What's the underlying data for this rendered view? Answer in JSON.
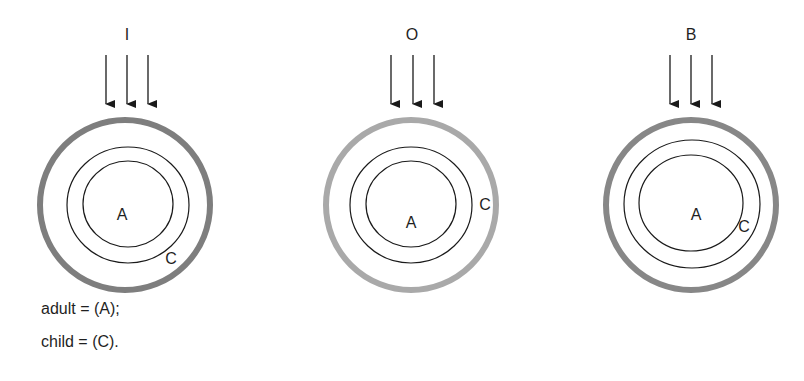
{
  "panels": [
    {
      "title": "I",
      "ring_color": "#7e7e7e",
      "outer": {
        "cx": 125,
        "cy": 205,
        "r": 85
      },
      "middle": {
        "cx": 128,
        "cy": 205,
        "rx": 61,
        "ry": 58
      },
      "inner": {
        "cx": 128,
        "cy": 204,
        "rx": 45,
        "ry": 43
      },
      "title_pos": {
        "x": 127,
        "y": 40
      },
      "arrows_x": [
        106,
        127,
        148
      ],
      "label_a": {
        "text": "A",
        "x": 122,
        "y": 220
      },
      "label_c": {
        "text": "C",
        "x": 171,
        "y": 264
      }
    },
    {
      "title": "O",
      "ring_color": "#a9a9a9",
      "outer": {
        "cx": 411,
        "cy": 205,
        "r": 85
      },
      "middle": {
        "cx": 411,
        "cy": 205,
        "rx": 61,
        "ry": 58
      },
      "inner": {
        "cx": 411,
        "cy": 204,
        "rx": 45,
        "ry": 43
      },
      "title_pos": {
        "x": 412,
        "y": 40
      },
      "arrows_x": [
        391,
        413,
        434
      ],
      "label_a": {
        "text": "A",
        "x": 411,
        "y": 228
      },
      "label_c": {
        "text": "C",
        "x": 485,
        "y": 210
      }
    },
    {
      "title": "B",
      "ring_color": "#878787",
      "outer": {
        "cx": 691,
        "cy": 205,
        "r": 85
      },
      "middle": {
        "cx": 692,
        "cy": 204,
        "rx": 68,
        "ry": 64
      },
      "inner": {
        "cx": 691,
        "cy": 203,
        "rx": 52,
        "ry": 48
      },
      "title_pos": {
        "x": 691,
        "y": 40
      },
      "arrows_x": [
        670,
        691,
        712
      ],
      "label_a": {
        "text": "A",
        "x": 696,
        "y": 220
      },
      "label_c": {
        "text": "C",
        "x": 744,
        "y": 232
      }
    }
  ],
  "arrow": {
    "top": 55,
    "bottom": 114,
    "color": "#1a1a1a"
  },
  "legend": {
    "lines": [
      "adult = (A);",
      "child = (C)."
    ]
  }
}
